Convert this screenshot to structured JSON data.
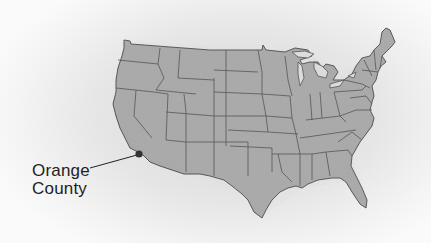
{
  "map": {
    "region": "Contiguous United States",
    "style": "grayscale shaded-relief with state borders",
    "colors": {
      "land": "#a9a9a9",
      "border": "#555555",
      "marker": "#333333",
      "background": "#e6e6e6"
    },
    "marker": {
      "name": "Orange County",
      "x": 139,
      "y": 154
    },
    "callout": {
      "line1": "Orange",
      "line2": "County"
    }
  }
}
